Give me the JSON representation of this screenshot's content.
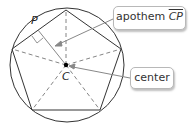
{
  "diagram": {
    "labels": {
      "point_p": "P",
      "point_c": "C"
    },
    "callouts": {
      "apothem": {
        "text": "apothem ",
        "segment": "CP"
      },
      "center": {
        "text": "center"
      }
    },
    "colors": {
      "stroke": "#333333",
      "dashed": "#777777",
      "arrow": "#888888",
      "callout_border": "#b8b8b8"
    }
  }
}
